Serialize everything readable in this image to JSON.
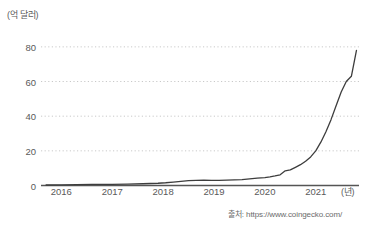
{
  "chart_data": {
    "type": "line",
    "title": "",
    "subtitle": "",
    "xlabel": "(년)",
    "ylabel": "(억 달러)",
    "xlim": [
      2015.6,
      2021.85
    ],
    "ylim": [
      0,
      88
    ],
    "yticks": [
      0,
      20,
      40,
      60,
      80
    ],
    "ytick_labels": [
      "0",
      "20",
      "40",
      "60",
      "80"
    ],
    "xticks": [
      2016,
      2017,
      2018,
      2019,
      2020,
      2021
    ],
    "xtick_labels": [
      "2016",
      "2017",
      "2018",
      "2019",
      "2020",
      "2021"
    ],
    "grid": "horizontal-dotted",
    "legend": "none",
    "line_color": "#3d3d3d",
    "source": "출처: https://www.coingecko.com/",
    "series": [
      {
        "name": "스테이블코인 시가총액",
        "x": [
          2015.7,
          2016.0,
          2016.3,
          2016.6,
          2017.0,
          2017.3,
          2017.6,
          2017.9,
          2018.05,
          2018.2,
          2018.35,
          2018.5,
          2018.65,
          2018.8,
          2018.95,
          2019.1,
          2019.25,
          2019.4,
          2019.55,
          2019.7,
          2019.85,
          2020.0,
          2020.1,
          2020.2,
          2020.3,
          2020.4,
          2020.5,
          2020.6,
          2020.7,
          2020.8,
          2020.9,
          2021.0,
          2021.1,
          2021.2,
          2021.3,
          2021.4,
          2021.5,
          2021.6,
          2021.7,
          2021.8
        ],
        "y": [
          0.3,
          0.4,
          0.5,
          0.6,
          0.7,
          0.8,
          1.0,
          1.3,
          1.6,
          2.0,
          2.4,
          2.8,
          3.0,
          3.1,
          3.0,
          3.0,
          3.1,
          3.2,
          3.4,
          3.8,
          4.2,
          4.6,
          5.0,
          5.5,
          6.2,
          8.5,
          9.0,
          10.5,
          12.0,
          14.0,
          16.5,
          20.0,
          25.0,
          31.0,
          38.0,
          46.0,
          54.0,
          60.0,
          63.0,
          78.0
        ]
      }
    ]
  }
}
